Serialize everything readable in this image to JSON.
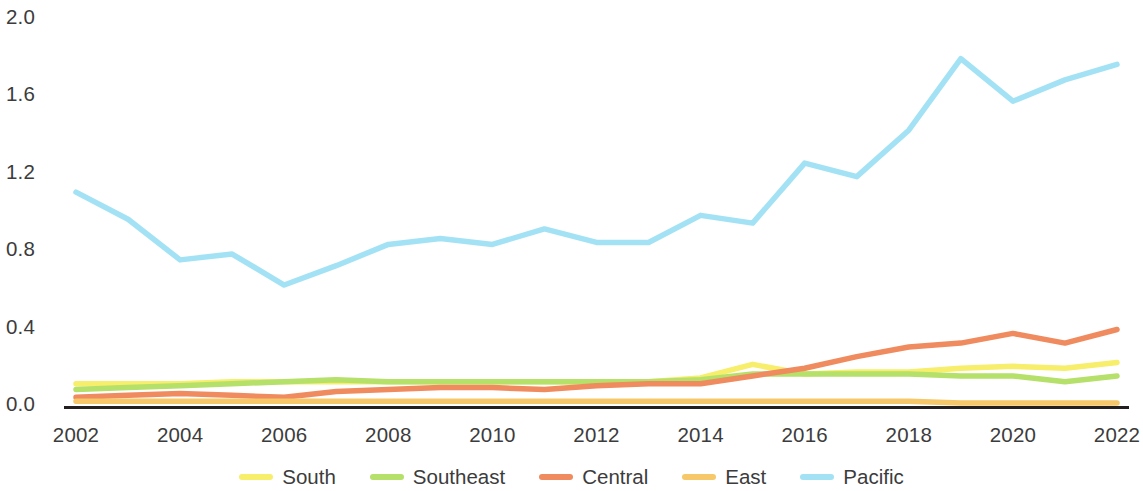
{
  "chart_data": {
    "type": "line",
    "title": "",
    "subtitle": "",
    "xlabel": "",
    "ylabel": "",
    "x": [
      2002,
      2003,
      2004,
      2005,
      2006,
      2007,
      2008,
      2009,
      2010,
      2011,
      2012,
      2013,
      2014,
      2015,
      2016,
      2017,
      2018,
      2019,
      2020,
      2021,
      2022
    ],
    "xlim": [
      2002,
      2022
    ],
    "ylim": [
      0.0,
      2.0
    ],
    "grid": false,
    "legend_position": "bottom",
    "x_tick_labels": [
      "2002",
      "2004",
      "2006",
      "2008",
      "2010",
      "2012",
      "2014",
      "2016",
      "2018",
      "2020",
      "2022"
    ],
    "x_tick_values": [
      2002,
      2004,
      2006,
      2008,
      2010,
      2012,
      2014,
      2016,
      2018,
      2020,
      2022
    ],
    "y_tick_labels": [
      "0.0",
      "0.4",
      "0.8",
      "1.2",
      "1.6",
      "2.0"
    ],
    "y_tick_values": [
      0.0,
      0.4,
      0.8,
      1.2,
      1.6,
      2.0
    ],
    "series": [
      {
        "name": "South",
        "color": "#f7ee6b",
        "values": [
          0.11,
          0.11,
          0.11,
          0.12,
          0.12,
          0.12,
          0.12,
          0.12,
          0.12,
          0.12,
          0.12,
          0.12,
          0.14,
          0.21,
          0.16,
          0.17,
          0.17,
          0.19,
          0.2,
          0.19,
          0.22
        ]
      },
      {
        "name": "Southeast",
        "color": "#b5e06a",
        "values": [
          0.08,
          0.09,
          0.1,
          0.11,
          0.12,
          0.13,
          0.12,
          0.12,
          0.12,
          0.12,
          0.12,
          0.12,
          0.13,
          0.16,
          0.16,
          0.16,
          0.16,
          0.15,
          0.15,
          0.12,
          0.15
        ]
      },
      {
        "name": "Central",
        "color": "#ef8b5e",
        "values": [
          0.04,
          0.05,
          0.06,
          0.05,
          0.04,
          0.07,
          0.08,
          0.09,
          0.09,
          0.08,
          0.1,
          0.11,
          0.11,
          0.15,
          0.19,
          0.25,
          0.3,
          0.32,
          0.37,
          0.32,
          0.39
        ]
      },
      {
        "name": "East",
        "color": "#f6c86a",
        "values": [
          0.02,
          0.02,
          0.02,
          0.02,
          0.02,
          0.02,
          0.02,
          0.02,
          0.02,
          0.02,
          0.02,
          0.02,
          0.02,
          0.02,
          0.02,
          0.02,
          0.02,
          0.01,
          0.01,
          0.01,
          0.01
        ]
      },
      {
        "name": "Pacific",
        "color": "#a3e2f5",
        "values": [
          1.1,
          0.96,
          0.75,
          0.78,
          0.62,
          0.72,
          0.83,
          0.86,
          0.83,
          0.91,
          0.84,
          0.84,
          0.98,
          0.94,
          1.25,
          1.18,
          1.42,
          1.79,
          1.57,
          1.68,
          1.76
        ]
      }
    ],
    "axis_line_color": "#231f20"
  },
  "legend": {
    "items": [
      {
        "label": "South",
        "color": "#f7ee6b"
      },
      {
        "label": "Southeast",
        "color": "#b5e06a"
      },
      {
        "label": "Central",
        "color": "#ef8b5e"
      },
      {
        "label": "East",
        "color": "#f6c86a"
      },
      {
        "label": "Pacific",
        "color": "#a3e2f5"
      }
    ]
  }
}
